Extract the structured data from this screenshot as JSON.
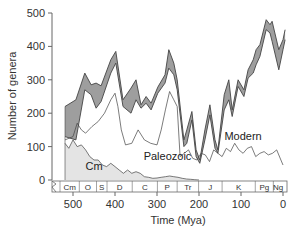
{
  "chart_data": {
    "type": "area",
    "title": "",
    "xlabel": "Time (Mya)",
    "ylabel": "Number of genera",
    "xlim": [
      540,
      0
    ],
    "ylim": [
      0,
      500
    ],
    "x_ticks": [
      500,
      400,
      300,
      200,
      100,
      0
    ],
    "y_ticks": [
      0,
      100,
      200,
      300,
      400,
      500
    ],
    "grid": false,
    "legend": "inline labels",
    "series_labels": [
      {
        "name": "Modern",
        "x": 95,
        "y": 120
      },
      {
        "name": "Paleozoic",
        "x": 275,
        "y": 60
      },
      {
        "name": "Cm",
        "x": 450,
        "y": 30
      }
    ],
    "total_upper": {
      "x": [
        519,
        493,
        472,
        457,
        445,
        433,
        410,
        398,
        381,
        362,
        350,
        338,
        326,
        314,
        298,
        281,
        272,
        260,
        252,
        236,
        229,
        217,
        207,
        198,
        186,
        174,
        162,
        155,
        140,
        129,
        121,
        107,
        93,
        83,
        71,
        64,
        55,
        40,
        31,
        26,
        10,
        0,
        -5
      ],
      "values": [
        220,
        240,
        320,
        285,
        290,
        282,
        360,
        385,
        240,
        275,
        300,
        225,
        250,
        230,
        278,
        315,
        390,
        350,
        300,
        120,
        150,
        205,
        90,
        60,
        150,
        225,
        120,
        90,
        255,
        300,
        210,
        300,
        270,
        330,
        360,
        390,
        405,
        480,
        465,
        475,
        390,
        420,
        450
      ]
    },
    "total_lower": {
      "x": [
        519,
        493,
        472,
        457,
        445,
        433,
        410,
        398,
        381,
        362,
        350,
        338,
        326,
        314,
        298,
        281,
        272,
        260,
        252,
        236,
        229,
        217,
        207,
        198,
        186,
        174,
        162,
        155,
        140,
        129,
        121,
        107,
        93,
        83,
        71,
        64,
        55,
        40,
        31,
        26,
        10,
        0,
        -5
      ],
      "values": [
        130,
        120,
        270,
        255,
        215,
        235,
        320,
        350,
        220,
        200,
        240,
        215,
        230,
        210,
        260,
        290,
        335,
        315,
        270,
        100,
        110,
        180,
        70,
        50,
        120,
        195,
        95,
        80,
        210,
        240,
        190,
        280,
        250,
        305,
        320,
        345,
        370,
        450,
        440,
        415,
        330,
        390,
        420
      ]
    },
    "paleozoic_upper": {
      "x": [
        519,
        500,
        490,
        480,
        470,
        455,
        440,
        425,
        410,
        400,
        393,
        385,
        375,
        360,
        345,
        330,
        315,
        300,
        290,
        280,
        270,
        260,
        252,
        245,
        235,
        225,
        215,
        205,
        195,
        185,
        175,
        165,
        155,
        145,
        135,
        125,
        115,
        105,
        95,
        85,
        75,
        65,
        55,
        45,
        35,
        25,
        15,
        5,
        0
      ],
      "values": [
        120,
        130,
        170,
        150,
        140,
        160,
        175,
        200,
        240,
        260,
        220,
        150,
        105,
        110,
        150,
        120,
        110,
        105,
        150,
        210,
        265,
        240,
        220,
        70,
        80,
        90,
        65,
        60,
        80,
        75,
        55,
        90,
        80,
        70,
        95,
        85,
        110,
        90,
        80,
        95,
        100,
        70,
        80,
        85,
        75,
        80,
        90,
        60,
        45
      ]
    },
    "cambrian_upper": {
      "x": [
        519,
        510,
        500,
        490,
        480,
        470,
        460,
        450,
        440,
        430,
        420,
        410,
        400,
        390,
        380,
        370,
        360,
        350,
        340,
        330,
        320,
        310,
        300,
        290,
        280,
        270,
        260,
        250,
        240,
        230,
        220,
        210,
        200
      ],
      "values": [
        110,
        95,
        120,
        100,
        105,
        90,
        70,
        60,
        60,
        45,
        40,
        50,
        40,
        30,
        20,
        30,
        20,
        25,
        20,
        10,
        8,
        5,
        6,
        8,
        10,
        12,
        10,
        8,
        5,
        3,
        2,
        1,
        0
      ]
    },
    "periods": [
      {
        "label": "Cm",
        "start": 541,
        "end": 485
      },
      {
        "label": "O",
        "start": 485,
        "end": 444
      },
      {
        "label": "S",
        "start": 444,
        "end": 419
      },
      {
        "label": "D",
        "start": 419,
        "end": 359
      },
      {
        "label": "C",
        "start": 359,
        "end": 299
      },
      {
        "label": "P",
        "start": 299,
        "end": 252
      },
      {
        "label": "Tr",
        "start": 252,
        "end": 201
      },
      {
        "label": "J",
        "start": 201,
        "end": 145
      },
      {
        "label": "K",
        "start": 145,
        "end": 66
      },
      {
        "label": "Pg",
        "start": 66,
        "end": 23
      },
      {
        "label": "Ng",
        "start": 23,
        "end": 0
      }
    ],
    "colors": {
      "modern_band": "#9e9e9e",
      "cambrian_fill": "#e4e4e4",
      "line": "#444444",
      "axis": "#666666"
    }
  }
}
